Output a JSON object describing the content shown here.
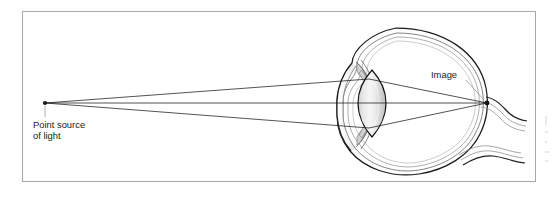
{
  "figure": {
    "type": "anatomical-optics-diagram",
    "labels": {
      "point_source_line1": "Point source",
      "point_source_line2": "of light",
      "image": "Image"
    },
    "icons": {
      "point_source": "point-source-dot",
      "image_point": "image-point-dot"
    },
    "colors": {
      "page_background": "#ffffff",
      "frame_border": "#a8a8a8",
      "ray_stroke": "#1a1a1a",
      "label_text": "#1a1a1a",
      "leader_line": "#8d8d8d",
      "eye_outline": "#1c1c1c",
      "eye_coat_mid": "#6f6f6f",
      "eye_coat_inner": "#9a9a9a",
      "lens_fill_light": "#f2f2f2",
      "lens_fill_shadow": "#b9b9b9"
    },
    "geometry": {
      "frame": {
        "x": 22,
        "y": 11,
        "width": 514,
        "height": 171
      },
      "point_source": {
        "x": 45,
        "y": 103
      },
      "image_point": {
        "x": 487,
        "y": 103
      },
      "lens_center": {
        "x": 372,
        "y": 103
      },
      "ray_count": 3
    },
    "parts": [
      "cornea",
      "anterior chamber",
      "iris",
      "lens",
      "vitreous chamber",
      "retina",
      "choroid",
      "sclera",
      "optic nerve"
    ]
  }
}
